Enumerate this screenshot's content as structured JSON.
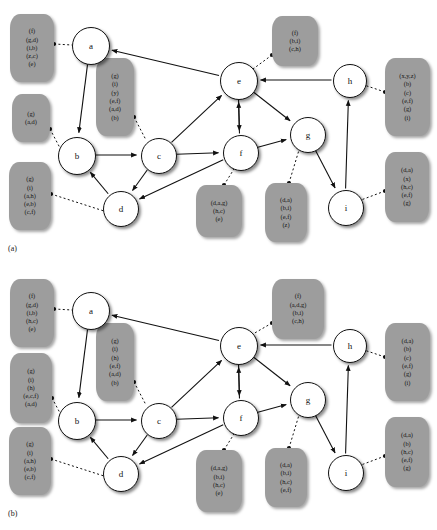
{
  "figure": {
    "panels": [
      {
        "id": "a",
        "caption": "(a)",
        "nodes": [
          {
            "id": "a",
            "label": "a",
            "x": 90,
            "y": 45,
            "r": 18
          },
          {
            "id": "b",
            "label": "b",
            "x": 76,
            "y": 155,
            "r": 18
          },
          {
            "id": "c",
            "label": "c",
            "x": 158,
            "y": 155,
            "r": 17
          },
          {
            "id": "d",
            "label": "d",
            "x": 120,
            "y": 208,
            "r": 17
          },
          {
            "id": "e",
            "label": "e",
            "x": 238,
            "y": 80,
            "r": 18
          },
          {
            "id": "f",
            "label": "f",
            "x": 240,
            "y": 152,
            "r": 17
          },
          {
            "id": "g",
            "label": "g",
            "x": 307,
            "y": 134,
            "r": 17
          },
          {
            "id": "h",
            "label": "h",
            "x": 349,
            "y": 80,
            "r": 16
          },
          {
            "id": "i",
            "label": "i",
            "x": 345,
            "y": 207,
            "r": 17
          }
        ],
        "edges": [
          {
            "from": "a",
            "to": "b",
            "type": "solid"
          },
          {
            "from": "e",
            "to": "a",
            "type": "solid"
          },
          {
            "from": "b",
            "to": "c",
            "type": "solid"
          },
          {
            "from": "c",
            "to": "e",
            "type": "solid"
          },
          {
            "from": "c",
            "to": "f",
            "type": "solid"
          },
          {
            "from": "c",
            "to": "d",
            "type": "solid"
          },
          {
            "from": "d",
            "to": "b",
            "type": "solid"
          },
          {
            "from": "e",
            "to": "f",
            "type": "solid"
          },
          {
            "from": "e",
            "to": "g",
            "type": "solid"
          },
          {
            "from": "f",
            "to": "e",
            "type": "solid"
          },
          {
            "from": "f",
            "to": "d",
            "type": "solid"
          },
          {
            "from": "f",
            "to": "g",
            "type": "solid"
          },
          {
            "from": "g",
            "to": "i",
            "type": "solid"
          },
          {
            "from": "h",
            "to": "e",
            "type": "solid"
          },
          {
            "from": "i",
            "to": "h",
            "type": "solid"
          }
        ],
        "label_boxes": [
          {
            "id": "box-a-left",
            "attached_to": "a",
            "x": 10,
            "y": 14,
            "w": 44,
            "h": 64,
            "lines": [
              "(f)",
              "(g,d)",
              "(i,b)",
              "(z,c)",
              "(e)"
            ]
          },
          {
            "id": "box-b-upper",
            "attached_to": "b",
            "x": 12,
            "y": 94,
            "w": 38,
            "h": 44,
            "lines": [
              "(g)",
              "(a,d)"
            ]
          },
          {
            "id": "box-b-lower",
            "attached_to": "b",
            "x": 9,
            "y": 162,
            "w": 42,
            "h": 64,
            "lines": [
              "(g)",
              "(i)",
              "(a,h)",
              "(e,b)",
              "(c,f)"
            ]
          },
          {
            "id": "box-c",
            "attached_to": "c",
            "x": 96,
            "y": 58,
            "w": 38,
            "h": 74,
            "lines": [
              "(g)",
              "(i)",
              "(y)",
              "(e,f)",
              "(a,d)",
              "(b)"
            ]
          },
          {
            "id": "box-e",
            "attached_to": "e",
            "x": 272,
            "y": 16,
            "w": 46,
            "h": 46,
            "lines": [
              "(f)",
              "(b,i)",
              "(c,h)"
            ]
          },
          {
            "id": "box-h",
            "attached_to": "h",
            "x": 385,
            "y": 58,
            "w": 45,
            "h": 74,
            "lines": [
              "(x,y,z)",
              "(b)",
              "(c)",
              "(e,f)",
              "(g)",
              "(i)"
            ]
          },
          {
            "id": "box-f",
            "attached_to": "f",
            "x": 196,
            "y": 185,
            "w": 46,
            "h": 48,
            "lines": [
              "(d,a,g)",
              "(h,c)",
              "(e)"
            ]
          },
          {
            "id": "box-g",
            "attached_to": "g",
            "x": 265,
            "y": 183,
            "w": 42,
            "h": 55,
            "lines": [
              "(d,a)",
              "(b,i)",
              "(e,f)",
              "(z)"
            ]
          },
          {
            "id": "box-i",
            "attached_to": "i",
            "x": 385,
            "y": 152,
            "w": 44,
            "h": 66,
            "lines": [
              "(d,a)",
              "(x)",
              "(h,c)",
              "(e,f)",
              "(g)"
            ]
          }
        ],
        "connectors": [
          {
            "box": "box-a-left",
            "bx": 54,
            "by": 44,
            "nx": 72,
            "ny": 45
          },
          {
            "box": "box-b-upper",
            "bx": 50,
            "by": 129,
            "nx": 60,
            "ny": 148
          },
          {
            "box": "box-b-lower",
            "bx": 51,
            "by": 194,
            "nx": 104,
            "ny": 211
          },
          {
            "box": "box-c",
            "bx": 134,
            "by": 117,
            "nx": 146,
            "ny": 140
          },
          {
            "box": "box-e",
            "bx": 272,
            "by": 55,
            "nx": 253,
            "ny": 69
          },
          {
            "box": "box-h",
            "bx": 385,
            "by": 92,
            "nx": 364,
            "ny": 85
          },
          {
            "box": "box-f",
            "bx": 224,
            "by": 185,
            "nx": 234,
            "ny": 169
          },
          {
            "box": "box-g",
            "bx": 289,
            "by": 183,
            "nx": 299,
            "ny": 150
          },
          {
            "box": "box-i",
            "bx": 385,
            "by": 191,
            "nx": 361,
            "ny": 200
          }
        ]
      },
      {
        "id": "b",
        "caption": "(b)",
        "nodes": [
          {
            "id": "a",
            "label": "a",
            "x": 90,
            "y": 45,
            "r": 18
          },
          {
            "id": "b",
            "label": "b",
            "x": 76,
            "y": 155,
            "r": 18
          },
          {
            "id": "c",
            "label": "c",
            "x": 158,
            "y": 155,
            "r": 17
          },
          {
            "id": "d",
            "label": "d",
            "x": 120,
            "y": 208,
            "r": 17
          },
          {
            "id": "e",
            "label": "e",
            "x": 238,
            "y": 80,
            "r": 18
          },
          {
            "id": "f",
            "label": "f",
            "x": 240,
            "y": 152,
            "r": 17
          },
          {
            "id": "g",
            "label": "g",
            "x": 307,
            "y": 134,
            "r": 17
          },
          {
            "id": "h",
            "label": "h",
            "x": 349,
            "y": 80,
            "r": 16
          },
          {
            "id": "i",
            "label": "i",
            "x": 345,
            "y": 207,
            "r": 17
          }
        ],
        "edges": [
          {
            "from": "a",
            "to": "b",
            "type": "solid"
          },
          {
            "from": "e",
            "to": "a",
            "type": "solid"
          },
          {
            "from": "b",
            "to": "c",
            "type": "solid"
          },
          {
            "from": "c",
            "to": "e",
            "type": "solid"
          },
          {
            "from": "c",
            "to": "f",
            "type": "solid"
          },
          {
            "from": "c",
            "to": "d",
            "type": "solid"
          },
          {
            "from": "d",
            "to": "b",
            "type": "solid"
          },
          {
            "from": "e",
            "to": "f",
            "type": "solid"
          },
          {
            "from": "e",
            "to": "g",
            "type": "solid"
          },
          {
            "from": "f",
            "to": "e",
            "type": "solid"
          },
          {
            "from": "f",
            "to": "d",
            "type": "solid"
          },
          {
            "from": "f",
            "to": "g",
            "type": "solid"
          },
          {
            "from": "g",
            "to": "i",
            "type": "solid"
          },
          {
            "from": "h",
            "to": "e",
            "type": "solid"
          },
          {
            "from": "i",
            "to": "h",
            "type": "solid"
          }
        ],
        "label_boxes": [
          {
            "id": "box-a-left",
            "attached_to": "a",
            "x": 10,
            "y": 14,
            "w": 44,
            "h": 64,
            "lines": [
              "(f)",
              "(g,d)",
              "(i,b)",
              "(h,c)",
              "(e)"
            ]
          },
          {
            "id": "box-b-upper",
            "attached_to": "b",
            "x": 10,
            "y": 88,
            "w": 42,
            "h": 66,
            "lines": [
              "(g)",
              "(i)",
              "(h)",
              "(e,c,f)",
              "(a,d)"
            ]
          },
          {
            "id": "box-b-lower",
            "attached_to": "b",
            "x": 9,
            "y": 162,
            "w": 42,
            "h": 64,
            "lines": [
              "(g)",
              "(i)",
              "(a,h)",
              "(e,b)",
              "(c,f)"
            ]
          },
          {
            "id": "box-c",
            "attached_to": "c",
            "x": 96,
            "y": 58,
            "w": 38,
            "h": 74,
            "lines": [
              "(g)",
              "(i)",
              "(h)",
              "(e,f)",
              "(a,d)",
              "(b)"
            ]
          },
          {
            "id": "box-e",
            "attached_to": "e",
            "x": 272,
            "y": 14,
            "w": 52,
            "h": 56,
            "lines": [
              "(f)",
              "(a,d,g)",
              "(b,i)",
              "(c,h)"
            ]
          },
          {
            "id": "box-h",
            "attached_to": "h",
            "x": 385,
            "y": 58,
            "w": 45,
            "h": 74,
            "lines": [
              "(d,a)",
              "(b)",
              "(c)",
              "(e,f)",
              "(g)",
              "(i)"
            ]
          },
          {
            "id": "box-f",
            "attached_to": "f",
            "x": 196,
            "y": 185,
            "w": 46,
            "h": 58,
            "lines": [
              "(d,a,g)",
              "(b,i)",
              "(h,c)",
              "(e)"
            ]
          },
          {
            "id": "box-g",
            "attached_to": "g",
            "x": 265,
            "y": 183,
            "w": 42,
            "h": 55,
            "lines": [
              "(d,a)",
              "(b,i)",
              "(h,c)",
              "(e,f)"
            ]
          },
          {
            "id": "box-i",
            "attached_to": "i",
            "x": 385,
            "y": 152,
            "w": 44,
            "h": 66,
            "lines": [
              "(d,a)",
              "(b)",
              "(h,c)",
              "(e,f)",
              "(g)"
            ]
          }
        ],
        "connectors": [
          {
            "box": "box-a-left",
            "bx": 54,
            "by": 44,
            "nx": 72,
            "ny": 45
          },
          {
            "box": "box-b-upper",
            "bx": 52,
            "by": 133,
            "nx": 60,
            "ny": 148
          },
          {
            "box": "box-b-lower",
            "bx": 51,
            "by": 194,
            "nx": 104,
            "ny": 211
          },
          {
            "box": "box-c",
            "bx": 134,
            "by": 117,
            "nx": 146,
            "ny": 140
          },
          {
            "box": "box-e",
            "bx": 272,
            "by": 58,
            "nx": 253,
            "ny": 69
          },
          {
            "box": "box-h",
            "bx": 385,
            "by": 92,
            "nx": 364,
            "ny": 85
          },
          {
            "box": "box-f",
            "bx": 224,
            "by": 185,
            "nx": 234,
            "ny": 169
          },
          {
            "box": "box-g",
            "bx": 289,
            "by": 183,
            "nx": 299,
            "ny": 150
          },
          {
            "box": "box-i",
            "bx": 385,
            "by": 191,
            "nx": 361,
            "ny": 200
          }
        ]
      }
    ]
  },
  "colors": {
    "label_box_fill": "#9d9d9d",
    "node_fill": "#ffffff",
    "stroke": "#111111",
    "background": "#ffffff"
  }
}
